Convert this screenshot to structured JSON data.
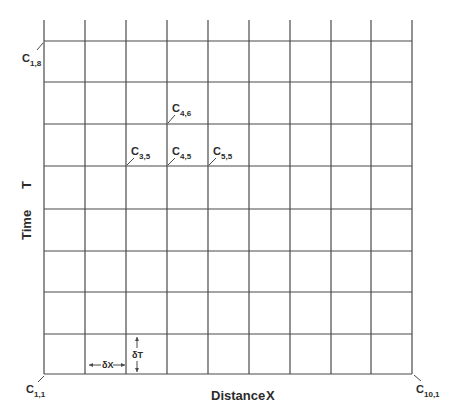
{
  "diagram": {
    "colors": {
      "line": "#4a4a4a",
      "text": "#2b2b2b",
      "background": "#ffffff"
    },
    "grid": {
      "columns": 9,
      "rows": 8,
      "x_lines": [
        44,
        85,
        126,
        167,
        208,
        249,
        290,
        331,
        371,
        412
      ],
      "y_lines": [
        41,
        82,
        124,
        166,
        209,
        251,
        292,
        334,
        374
      ],
      "vertical_extension_top": 20
    },
    "axes": {
      "x_label": "Distance",
      "x_symbol": "X",
      "y_label": "Time",
      "y_symbol": "T"
    },
    "nodes": [
      {
        "id": "c_1_8",
        "letter": "C",
        "sub": "1,8",
        "col": 0,
        "row": 0
      },
      {
        "id": "c_4_6",
        "letter": "C",
        "sub": "4,6",
        "col": 3,
        "row": 2
      },
      {
        "id": "c_3_5",
        "letter": "C",
        "sub": "3,5",
        "col": 2,
        "row": 3
      },
      {
        "id": "c_4_5",
        "letter": "C",
        "sub": "4,5",
        "col": 3,
        "row": 3
      },
      {
        "id": "c_5_5",
        "letter": "C",
        "sub": "5,5",
        "col": 4,
        "row": 3
      },
      {
        "id": "c_1_1",
        "letter": "C",
        "sub": "1,1",
        "col": 0,
        "row": 8
      },
      {
        "id": "c_10_1",
        "letter": "C",
        "sub": "10,1",
        "col": 9,
        "row": 8
      }
    ],
    "increments": {
      "dx_label": "δX",
      "dt_label": "δT"
    }
  }
}
